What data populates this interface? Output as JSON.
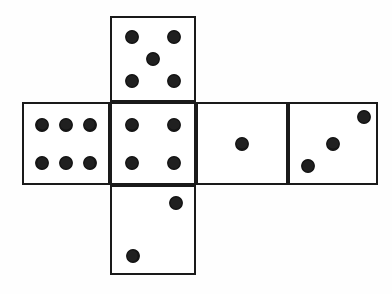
{
  "diagram": {
    "shape": "cross-net",
    "background_color": "#fefefe",
    "line_color": "#1a1a1a",
    "pip_color": "#151515",
    "canvas": {
      "width": 392,
      "height": 294
    },
    "face_size": {
      "width": 86,
      "height": 86
    },
    "pip_diameter": 13,
    "faces": [
      {
        "name": "top-face",
        "position": "top",
        "value": 5,
        "value_label": "5",
        "x": 110,
        "y": 16,
        "width": 86,
        "height": 86,
        "pips": [
          {
            "cx": 0.24,
            "cy": 0.23
          },
          {
            "cx": 0.76,
            "cy": 0.23
          },
          {
            "cx": 0.5,
            "cy": 0.5
          },
          {
            "cx": 0.24,
            "cy": 0.77
          },
          {
            "cx": 0.76,
            "cy": 0.77
          }
        ]
      },
      {
        "name": "left-face",
        "position": "middle-left",
        "value": 6,
        "value_label": "6",
        "x": 22,
        "y": 102,
        "width": 88,
        "height": 83,
        "pips": [
          {
            "cx": 0.22,
            "cy": 0.26
          },
          {
            "cx": 0.5,
            "cy": 0.26
          },
          {
            "cx": 0.78,
            "cy": 0.26
          },
          {
            "cx": 0.22,
            "cy": 0.75
          },
          {
            "cx": 0.5,
            "cy": 0.75
          },
          {
            "cx": 0.78,
            "cy": 0.75
          }
        ]
      },
      {
        "name": "center-face",
        "position": "middle-center",
        "value": 4,
        "value_label": "4",
        "x": 110,
        "y": 102,
        "width": 86,
        "height": 83,
        "pips": [
          {
            "cx": 0.24,
            "cy": 0.26
          },
          {
            "cx": 0.76,
            "cy": 0.26
          },
          {
            "cx": 0.24,
            "cy": 0.75
          },
          {
            "cx": 0.76,
            "cy": 0.75
          }
        ]
      },
      {
        "name": "right-inner-face",
        "position": "middle-right-inner",
        "value": 1,
        "value_label": "1",
        "x": 196,
        "y": 102,
        "width": 92,
        "height": 83,
        "pips": [
          {
            "cx": 0.5,
            "cy": 0.5
          }
        ]
      },
      {
        "name": "right-outer-face",
        "position": "middle-right-outer",
        "value": 3,
        "value_label": "3",
        "x": 288,
        "y": 102,
        "width": 90,
        "height": 83,
        "pips": [
          {
            "cx": 0.21,
            "cy": 0.78
          },
          {
            "cx": 0.5,
            "cy": 0.5
          },
          {
            "cx": 0.86,
            "cy": 0.17
          }
        ]
      },
      {
        "name": "bottom-face",
        "position": "bottom",
        "value": 2,
        "value_label": "2",
        "x": 110,
        "y": 185,
        "width": 86,
        "height": 90,
        "pips": [
          {
            "cx": 0.25,
            "cy": 0.8
          },
          {
            "cx": 0.78,
            "cy": 0.19
          }
        ]
      }
    ]
  }
}
